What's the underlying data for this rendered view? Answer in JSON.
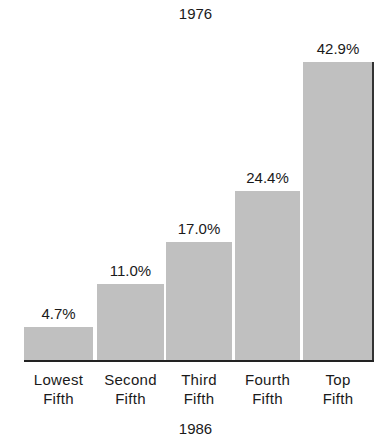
{
  "chart_data": {
    "type": "bar",
    "title": "1976",
    "subtitle": "1986",
    "categories": [
      "Lowest Fifth",
      "Second Fifth",
      "Third Fifth",
      "Fourth Fifth",
      "Top Fifth"
    ],
    "category_lines": [
      [
        "Lowest",
        "Fifth"
      ],
      [
        "Second",
        "Fifth"
      ],
      [
        "Third",
        "Fifth"
      ],
      [
        "Fourth",
        "Fifth"
      ],
      [
        "Top",
        "Fifth"
      ]
    ],
    "values": [
      4.7,
      11.0,
      17.0,
      24.4,
      42.9
    ],
    "value_labels": [
      "4.7%",
      "11.0%",
      "17.0%",
      "24.4%",
      "42.9%"
    ],
    "xlabel": "",
    "ylabel": "",
    "ylim": [
      0,
      42.9
    ],
    "grid": false,
    "legend": null,
    "bar_color": "#c9c9c9"
  }
}
